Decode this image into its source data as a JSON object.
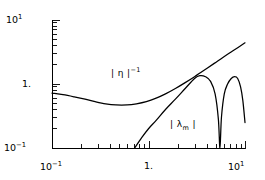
{
  "chart_data": {
    "type": "line",
    "title": "",
    "xlabel": "",
    "ylabel": "",
    "xscale": "log",
    "yscale": "log",
    "xlim": [
      0.1,
      10
    ],
    "ylim": [
      0.1,
      10
    ],
    "grid": false,
    "legend": "inline-annotations",
    "x_tick_labels": [
      "10⁻¹",
      "1.",
      "10¹"
    ],
    "x_tick_values": [
      0.1,
      1,
      10
    ],
    "y_tick_labels": [
      "10⁻¹",
      "1.",
      "10¹"
    ],
    "y_tick_values": [
      0.1,
      1,
      10
    ],
    "series": [
      {
        "name": "|η|⁻¹",
        "x": [
          0.1,
          0.13,
          0.17,
          0.22,
          0.28,
          0.36,
          0.46,
          0.6,
          0.75,
          0.95,
          1.2,
          1.5,
          1.9,
          2.4,
          3.0,
          3.8,
          4.8,
          6.0,
          7.5,
          10.0
        ],
        "y": [
          0.72,
          0.68,
          0.63,
          0.58,
          0.53,
          0.49,
          0.47,
          0.47,
          0.49,
          0.53,
          0.6,
          0.7,
          0.85,
          1.05,
          1.3,
          1.65,
          2.1,
          2.65,
          3.3,
          4.4
        ]
      },
      {
        "name": "|λₘ|",
        "x": [
          0.72,
          0.85,
          1.0,
          1.2,
          1.5,
          1.9,
          2.4,
          3.0,
          3.4,
          3.9,
          4.4,
          4.9,
          5.3,
          5.5,
          5.7,
          6.1,
          6.6,
          7.2,
          7.8,
          8.4,
          9.0,
          9.5,
          10.0
        ],
        "y": [
          0.1,
          0.145,
          0.2,
          0.27,
          0.4,
          0.58,
          0.85,
          1.22,
          1.35,
          1.3,
          1.1,
          0.7,
          0.28,
          0.1,
          0.3,
          0.7,
          1.0,
          1.22,
          1.3,
          1.22,
          0.9,
          0.55,
          0.25
        ]
      }
    ],
    "annotations": [
      {
        "name": "eta-inverse-label",
        "base": "| η |",
        "superscript": "−1",
        "x_px": 113,
        "y_px": 72
      },
      {
        "name": "lambda-m-label",
        "base_open": "| λ",
        "subscript": "m",
        "base_close": " |",
        "x_px": 172,
        "y_px": 125
      }
    ]
  },
  "axes": {
    "frame": {
      "left_px": 52,
      "right_px": 245,
      "top_px": 20,
      "bottom_px": 148
    }
  }
}
